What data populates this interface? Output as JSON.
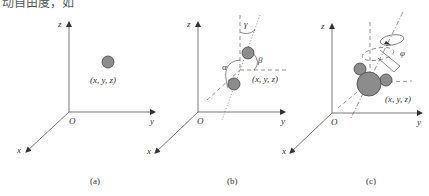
{
  "header": {
    "cropped_text": "动自由度，如"
  },
  "panels": [
    {
      "id": "a",
      "caption": "(a)",
      "axes": {
        "x": "x",
        "y": "y",
        "z": "z",
        "origin": "O"
      },
      "point_label": "(x, y, z)",
      "description": "single atom at a point"
    },
    {
      "id": "b",
      "caption": "(b)",
      "axes": {
        "x": "x",
        "y": "y",
        "z": "z",
        "origin": "O"
      },
      "point_label": "(x, y, z)",
      "angles": {
        "alpha": "α",
        "beta": "β",
        "gamma": "γ"
      },
      "description": "diatomic molecule with orientation angles"
    },
    {
      "id": "c",
      "caption": "(c)",
      "axes": {
        "x": "x",
        "y": "y",
        "z": "z",
        "origin": "O"
      },
      "point_label": "(x, y, z)",
      "angles": {
        "phi": "φ"
      },
      "description": "polyatomic molecule with rotation angle"
    }
  ],
  "colors": {
    "ball_fill": "#8c8c8c",
    "ball_stroke": "#444444",
    "axis": "#555555"
  }
}
